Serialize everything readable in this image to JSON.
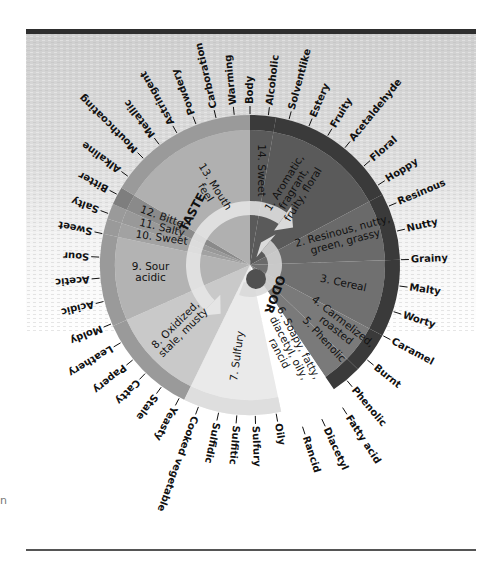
{
  "diagram": {
    "center_labels": {
      "taste": "TASTE",
      "odor": "ODOR"
    },
    "margin_mark": "n",
    "colors": {
      "odor_inner": "#5a5a5a",
      "odor_outer": "#3a3a3a",
      "odor_2": "#6a6a6a",
      "odor_3": "#707070",
      "odor_4": "#7a7a7a",
      "soapy": "#ffffff",
      "sulfury": "#eaeaea",
      "oxidized": "#c9c9c9",
      "sour": "#b3b3b3",
      "sweet": "#a2a2a2",
      "salty": "#999999",
      "bitter": "#8a8a8a",
      "mouthfeel": "#b0b0b0",
      "taste_outer": "#9a9a9a",
      "arrow": "#e8e8e8",
      "background": "#d6d6d6",
      "frame": "#2e2e2e"
    },
    "classes": [
      {
        "id": "sweet-14",
        "label": [
          "14. Sweet"
        ]
      },
      {
        "id": "aromatic-1",
        "label": [
          "1. Aromatic,",
          "fragrant,",
          "fruity, floral"
        ]
      },
      {
        "id": "resinous-2",
        "label": [
          "2. Resinous, nutty,",
          "green, grassy"
        ]
      },
      {
        "id": "cereal-3",
        "label": [
          "3. Cereal"
        ]
      },
      {
        "id": "caramelized-4",
        "label": [
          "4. Carmelized,",
          "roasted"
        ]
      },
      {
        "id": "phenolic-5",
        "label": [
          "5. Phenolic"
        ]
      },
      {
        "id": "soapy-6",
        "label": [
          "6. Soapy, fatty,",
          "diacetyl, oily,",
          "rancid"
        ]
      },
      {
        "id": "sulfury-7",
        "label": [
          "7. Sulfury"
        ]
      },
      {
        "id": "oxidized-8",
        "label": [
          "8. Oxidized,",
          "stale, musty"
        ]
      },
      {
        "id": "sour-9",
        "label": [
          "9. Sour",
          "acidic"
        ]
      },
      {
        "id": "sweet-10",
        "label": [
          "10. Sweet"
        ]
      },
      {
        "id": "salty-11",
        "label": [
          "11. Salty"
        ]
      },
      {
        "id": "bitter-12",
        "label": [
          "12. Bitter"
        ]
      },
      {
        "id": "mouthfeel-13",
        "label": [
          "13. Mouth",
          "feel"
        ]
      }
    ],
    "terms": [
      "Body",
      "Alcoholic",
      "Solventlike",
      "Estery",
      "Fruity",
      "Acetaldehyde",
      "Floral",
      "Hoppy",
      "Resinous",
      "Nutty",
      "Grainy",
      "Malty",
      "Worty",
      "Caramel",
      "Burnt",
      "Phenolic",
      "Fatty acid",
      "Diacetyl",
      "Rancid",
      "Oily",
      "Sulfury",
      "Sulfitic",
      "Sulfidic",
      "Cooked vegetable",
      "Yeasty",
      "Stale",
      "Catty",
      "Papery",
      "Leathery",
      "Moldy",
      "Acidic",
      "Acetic",
      "Sour",
      "Sweet",
      "Salty",
      "Bitter",
      "Alkaline",
      "Mouthcoating",
      "Metallic",
      "Astringent",
      "Powdery",
      "Carboration",
      "Warming"
    ]
  }
}
